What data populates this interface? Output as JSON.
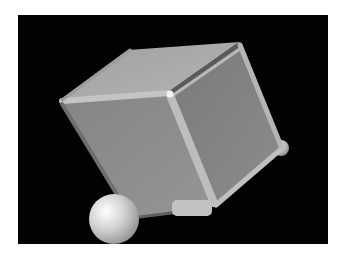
{
  "scene": {
    "description": "3D render of a gray cube with beveled edges tilted on a black background, resting on a white sphere",
    "background_color": "#020202",
    "page_color": "#ffffff",
    "objects": [
      {
        "name": "cube",
        "color": "#8a8a8a"
      },
      {
        "name": "large-sphere",
        "color": "#d8d8d8"
      },
      {
        "name": "small-sphere",
        "color": "#c8c8c8"
      }
    ]
  }
}
